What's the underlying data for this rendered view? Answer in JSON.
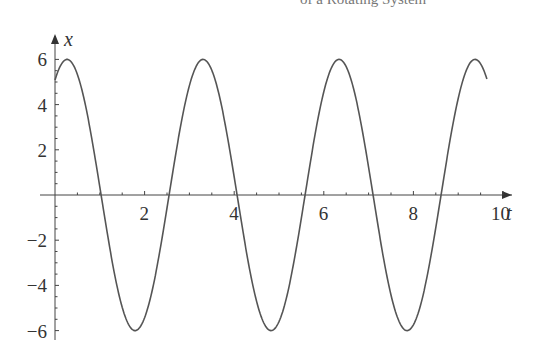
{
  "header": {
    "title_fragment": "of a Rotating System"
  },
  "chart_data": {
    "type": "line",
    "title": "",
    "xlabel": "t",
    "ylabel": "x",
    "xlim": [
      0,
      10.3
    ],
    "ylim": [
      -6,
      6.6
    ],
    "grid": false,
    "x_ticks": [
      2,
      4,
      6,
      8,
      10
    ],
    "x_tick_labels": [
      "2",
      "4",
      "6",
      "8",
      "10"
    ],
    "y_ticks": [
      -6,
      -4,
      -2,
      2,
      4,
      6
    ],
    "y_tick_labels": [
      "−6",
      "−4",
      "−2",
      "2",
      "4",
      "6"
    ],
    "series": [
      {
        "name": "x(t)",
        "model": "6*cos(2.07*(t-0.27))",
        "amplitude": 6,
        "omega": 2.07,
        "phase_t": 0.27,
        "t_start": 0,
        "t_end": 9.65,
        "color": "#555555",
        "key_points": [
          {
            "t": 0,
            "x": 5.1
          },
          {
            "t": 0.27,
            "x": 6
          },
          {
            "t": 1.03,
            "x": 0
          },
          {
            "t": 1.79,
            "x": -6
          },
          {
            "t": 2.55,
            "x": 0
          },
          {
            "t": 3.35,
            "x": 6
          },
          {
            "t": 4.1,
            "x": 0
          },
          {
            "t": 4.85,
            "x": -6
          },
          {
            "t": 5.6,
            "x": 0
          },
          {
            "t": 6.36,
            "x": 6
          },
          {
            "t": 7.1,
            "x": 0
          },
          {
            "t": 7.85,
            "x": -6
          },
          {
            "t": 8.6,
            "x": 0
          },
          {
            "t": 9.35,
            "x": 6
          },
          {
            "t": 9.65,
            "x": 4.75
          }
        ]
      }
    ]
  }
}
